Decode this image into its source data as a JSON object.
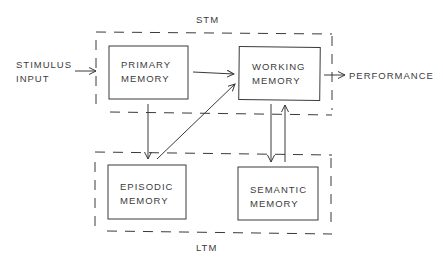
{
  "diagram": {
    "type": "memory-model-flowchart",
    "groups": [
      {
        "id": "stm",
        "label": "STM",
        "style": "dashed",
        "contains": [
          "primary",
          "working"
        ]
      },
      {
        "id": "ltm",
        "label": "LTM",
        "style": "dashed",
        "contains": [
          "episodic",
          "semantic"
        ]
      }
    ],
    "nodes": {
      "stimulus": {
        "line1": "STIMULUS",
        "line2": "INPUT"
      },
      "primary": {
        "line1": "PRIMARY",
        "line2": "MEMORY"
      },
      "working": {
        "line1": "WORKING",
        "line2": "MEMORY"
      },
      "episodic": {
        "line1": "EPISODIC",
        "line2": "MEMORY"
      },
      "semantic": {
        "line1": "SEMANTIC",
        "line2": "MEMORY"
      },
      "performance": {
        "label": "PERFORMANCE"
      }
    },
    "edges": [
      {
        "from": "stimulus",
        "to": "primary"
      },
      {
        "from": "primary",
        "to": "working"
      },
      {
        "from": "primary",
        "to": "episodic"
      },
      {
        "from": "episodic",
        "to": "working"
      },
      {
        "from": "working",
        "to": "semantic"
      },
      {
        "from": "semantic",
        "to": "working"
      },
      {
        "from": "working",
        "to": "performance"
      }
    ],
    "colors": {
      "stroke": "#3a3a3a",
      "background": "#ffffff"
    }
  }
}
